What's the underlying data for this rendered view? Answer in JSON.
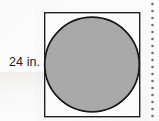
{
  "figure": {
    "type": "geometry-diagram",
    "dimension_label": "24 in.",
    "shapes": {
      "square": {
        "name": "square",
        "x": 44,
        "y": 12,
        "width": 96,
        "height": 105,
        "fill": "#ffffff",
        "stroke": "#1a1a1a",
        "stroke_width": 1.4
      },
      "circle": {
        "name": "inscribed-circle",
        "cx": 92,
        "cy": 64.5,
        "r": 47.5,
        "fill": "#a9a9a9",
        "stroke": "#121212",
        "stroke_width": 1.6
      }
    },
    "colors": {
      "background": "#fdfdfd",
      "circle_fill": "#a9a9a9",
      "outline": "#1a1a1a",
      "label_text": "#1b1b1b",
      "perforation": "#6e6e6e"
    }
  },
  "perforation": {
    "name": "perforated-edge",
    "dot_count": 17,
    "dot_color": "#6e6e6e",
    "dot_radius": 1.3,
    "spacing": 7
  }
}
